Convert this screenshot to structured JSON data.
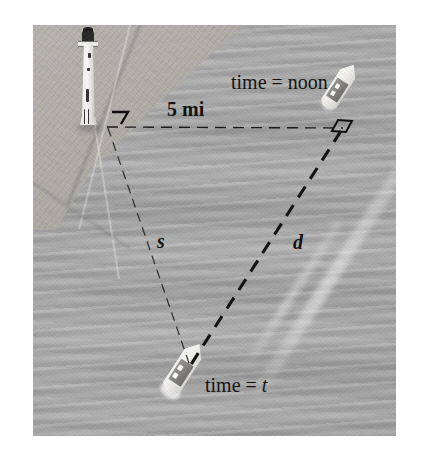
{
  "figure": {
    "medium": "grayscale aerial photograph with overlaid dashed geometry",
    "plate": {
      "x": 33,
      "y": 25,
      "width": 363,
      "height": 411,
      "background_color": "#ababab"
    },
    "canvas": {
      "width": 422,
      "height": 461,
      "background_color": "#ffffff"
    }
  },
  "labels": {
    "distance_baseline": "5 mi",
    "side_s": "s",
    "side_d": "d",
    "time_noon": "time = noon",
    "time_t_prefix": "time = ",
    "time_t_variable": "t"
  },
  "scene": {
    "lighthouse": {
      "name": "lighthouse",
      "position": "upper left on shoreline"
    },
    "ship_noon": {
      "name": "ship-at-noon",
      "position": "upper right"
    },
    "ship_time_t": {
      "name": "ship-at-time-t",
      "position": "lower center"
    },
    "shoreline": {
      "name": "shoreline",
      "position": "upper left"
    },
    "water": {
      "name": "water-surface"
    },
    "wake": {
      "name": "ship-wake"
    }
  },
  "geometry": {
    "vertices": {
      "lighthouse_vertex": {
        "x": 107,
        "y": 127
      },
      "noon_vertex": {
        "x": 343,
        "y": 128
      },
      "ship_t_vertex": {
        "x": 190,
        "y": 366
      }
    },
    "segments": [
      {
        "name": "baseline",
        "label": "5 mi",
        "style": "dashed-thin",
        "from": "lighthouse_vertex",
        "to": "noon_vertex"
      },
      {
        "name": "side-s",
        "label": "s",
        "style": "dashed-thin",
        "from": "lighthouse_vertex",
        "to": "ship_t_vertex"
      },
      {
        "name": "side-d",
        "label": "d",
        "style": "dashed-heavy",
        "from": "noon_vertex",
        "to": "ship_t_vertex"
      }
    ],
    "right_angle_marks": [
      {
        "name": "right-angle-lighthouse",
        "at": "lighthouse_vertex"
      },
      {
        "name": "right-angle-noon",
        "at": "noon_vertex"
      }
    ]
  },
  "colors": {
    "line_color": "#1a1a1a",
    "text_color": "#131313",
    "water_gray": "#adadad",
    "land_gray": "#b2afa8",
    "hull_white": "#fbfbf9",
    "deck_gray": "#83817d",
    "lantern_dark": "#2a2a2a"
  }
}
